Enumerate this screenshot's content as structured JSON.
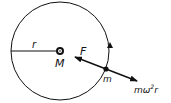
{
  "diagram": {
    "labels": {
      "radius": "r",
      "central_mass": "M",
      "force": "F",
      "orbiting_mass": "m",
      "centrifugal_m": "mω",
      "centrifugal_exp": "2",
      "centrifugal_r": "r"
    },
    "colors": {
      "stroke": "#111111",
      "background": "#ffffff"
    }
  }
}
